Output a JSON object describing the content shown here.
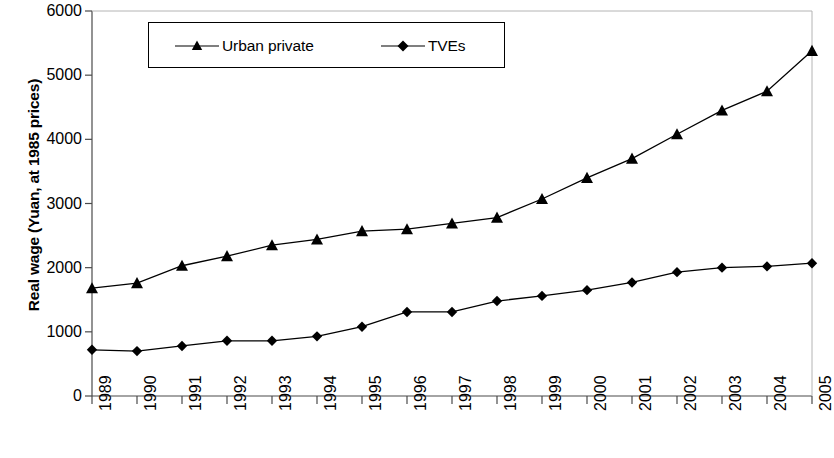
{
  "chart_data": {
    "type": "line",
    "title": "",
    "xlabel": "",
    "ylabel": "Real wage (Yuan, at 1985 prices)",
    "categories": [
      "1989",
      "1990",
      "1991",
      "1992",
      "1993",
      "1994",
      "1995",
      "1996",
      "1997",
      "1998",
      "1999",
      "2000",
      "2001",
      "2002",
      "2003",
      "2004",
      "2005"
    ],
    "xtick_labels": [
      "1989",
      "1990",
      "1991",
      "1992",
      "1993",
      "1994",
      "1995",
      "1996",
      "1997",
      "1998",
      "1999",
      "2000",
      "2001",
      "2002",
      "2003",
      "2004",
      "2005"
    ],
    "ytick_labels": [
      "0",
      "1000",
      "2000",
      "3000",
      "4000",
      "5000",
      "6000"
    ],
    "ytick_values": [
      0,
      1000,
      2000,
      3000,
      4000,
      5000,
      6000
    ],
    "ylim": [
      0,
      6000
    ],
    "grid": false,
    "legend_position": "top-left-inside",
    "series": [
      {
        "name": "Urban private",
        "marker": "triangle",
        "color": "#000000",
        "values": [
          1680,
          1760,
          2030,
          2180,
          2350,
          2440,
          2570,
          2600,
          2690,
          2780,
          3070,
          3400,
          3700,
          4080,
          4450,
          4750,
          5380
        ]
      },
      {
        "name": "TVEs",
        "marker": "diamond",
        "color": "#000000",
        "values": [
          720,
          700,
          780,
          860,
          860,
          930,
          1080,
          1310,
          1310,
          1480,
          1560,
          1650,
          1770,
          1930,
          2000,
          2020,
          2070
        ]
      }
    ]
  },
  "legend": {
    "entries": [
      {
        "label": "Urban private",
        "marker": "triangle"
      },
      {
        "label": "TVEs",
        "marker": "diamond"
      }
    ]
  },
  "axes": {
    "y_title": "Real wage (Yuan, at 1985 prices)"
  }
}
